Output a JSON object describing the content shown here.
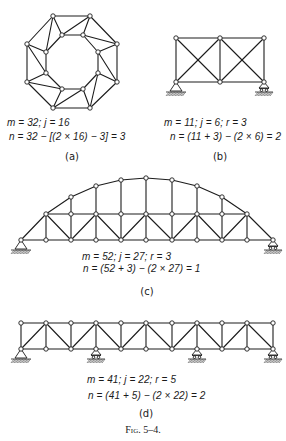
{
  "figure": {
    "caption": "Fig. 5–4.",
    "panels": [
      {
        "id": "a",
        "label": "(a)",
        "line1": "m = 32; j = 16",
        "line2": "n = 32 − [(2 × 16) − 3] = 3"
      },
      {
        "id": "b",
        "label": "(b)",
        "line1": "m = 11; j = 6; r = 3",
        "line2": "n = (11 + 3) − (2 × 6) = 2"
      },
      {
        "id": "c",
        "label": "(c)",
        "line1": "m = 52; j = 27; r = 3",
        "line2": "n = (52 + 3) − (2 × 27) = 1"
      },
      {
        "id": "d",
        "label": "(d)",
        "line1": "m = 41; j = 22; r = 5",
        "line2": "n = (41 + 5) − (2 × 22) = 2"
      }
    ]
  },
  "trusses": [
    {
      "id": "a",
      "description": "octagonal ring truss, free body (no supports)",
      "nodes": [
        [
          53,
          16
        ],
        [
          90,
          16
        ],
        [
          117,
          44
        ],
        [
          117,
          82
        ],
        [
          90,
          108
        ],
        [
          53,
          108
        ],
        [
          27,
          82
        ],
        [
          27,
          44
        ],
        [
          62,
          35
        ],
        [
          83,
          35
        ],
        [
          98,
          52
        ],
        [
          98,
          73
        ],
        [
          83,
          89
        ],
        [
          62,
          89
        ],
        [
          46,
          73
        ],
        [
          46,
          52
        ]
      ],
      "members": [
        [
          0,
          1
        ],
        [
          1,
          2
        ],
        [
          2,
          3
        ],
        [
          3,
          4
        ],
        [
          4,
          5
        ],
        [
          5,
          6
        ],
        [
          6,
          7
        ],
        [
          7,
          0
        ],
        [
          8,
          9
        ],
        [
          9,
          10
        ],
        [
          10,
          11
        ],
        [
          11,
          12
        ],
        [
          12,
          13
        ],
        [
          13,
          14
        ],
        [
          14,
          15
        ],
        [
          15,
          8
        ],
        [
          0,
          8
        ],
        [
          1,
          9
        ],
        [
          2,
          10
        ],
        [
          3,
          11
        ],
        [
          4,
          12
        ],
        [
          5,
          13
        ],
        [
          6,
          14
        ],
        [
          7,
          15
        ],
        [
          0,
          15
        ],
        [
          1,
          8
        ],
        [
          2,
          9
        ],
        [
          3,
          10
        ],
        [
          4,
          11
        ],
        [
          5,
          12
        ],
        [
          6,
          13
        ],
        [
          7,
          14
        ]
      ],
      "supports": []
    },
    {
      "id": "b",
      "description": "two-panel cross-braced truss",
      "nodes": [
        [
          176,
          38
        ],
        [
          220,
          38
        ],
        [
          264,
          38
        ],
        [
          176,
          82
        ],
        [
          220,
          82
        ],
        [
          264,
          82
        ]
      ],
      "members": [
        [
          0,
          1
        ],
        [
          1,
          2
        ],
        [
          3,
          4
        ],
        [
          4,
          5
        ],
        [
          0,
          3
        ],
        [
          1,
          4
        ],
        [
          2,
          5
        ],
        [
          0,
          4
        ],
        [
          1,
          3
        ],
        [
          1,
          5
        ],
        [
          2,
          4
        ]
      ],
      "supports": [
        {
          "type": "pin",
          "node": 3
        },
        {
          "type": "roller",
          "node": 5
        }
      ]
    },
    {
      "id": "c",
      "description": "arched truss",
      "nodes": [
        [
          21,
          240
        ],
        [
          46,
          240
        ],
        [
          71,
          240
        ],
        [
          96,
          240
        ],
        [
          121,
          240
        ],
        [
          146,
          240
        ],
        [
          172,
          240
        ],
        [
          197,
          240
        ],
        [
          222,
          240
        ],
        [
          247,
          240
        ],
        [
          273,
          240
        ],
        [
          46,
          214
        ],
        [
          71,
          214
        ],
        [
          96,
          214
        ],
        [
          121,
          214
        ],
        [
          146,
          214
        ],
        [
          172,
          214
        ],
        [
          197,
          214
        ],
        [
          222,
          214
        ],
        [
          247,
          214
        ],
        [
          71,
          197
        ],
        [
          96,
          186
        ],
        [
          121,
          180
        ],
        [
          146,
          178
        ],
        [
          172,
          180
        ],
        [
          197,
          186
        ],
        [
          222,
          197
        ]
      ],
      "members": [
        [
          0,
          1
        ],
        [
          1,
          2
        ],
        [
          2,
          3
        ],
        [
          3,
          4
        ],
        [
          4,
          5
        ],
        [
          5,
          6
        ],
        [
          6,
          7
        ],
        [
          7,
          8
        ],
        [
          8,
          9
        ],
        [
          9,
          10
        ],
        [
          11,
          12
        ],
        [
          12,
          13
        ],
        [
          13,
          14
        ],
        [
          14,
          15
        ],
        [
          15,
          16
        ],
        [
          16,
          17
        ],
        [
          17,
          18
        ],
        [
          18,
          19
        ],
        [
          0,
          11
        ],
        [
          10,
          19
        ],
        [
          1,
          11
        ],
        [
          2,
          12
        ],
        [
          3,
          13
        ],
        [
          4,
          14
        ],
        [
          5,
          15
        ],
        [
          6,
          16
        ],
        [
          7,
          17
        ],
        [
          8,
          18
        ],
        [
          9,
          19
        ],
        [
          11,
          2
        ],
        [
          13,
          2
        ],
        [
          13,
          4
        ],
        [
          15,
          4
        ],
        [
          15,
          6
        ],
        [
          17,
          6
        ],
        [
          17,
          8
        ],
        [
          19,
          8
        ],
        [
          12,
          20
        ],
        [
          13,
          21
        ],
        [
          14,
          22
        ],
        [
          15,
          23
        ],
        [
          16,
          24
        ],
        [
          17,
          25
        ],
        [
          18,
          26
        ],
        [
          11,
          20
        ],
        [
          20,
          21
        ],
        [
          21,
          22
        ],
        [
          22,
          23
        ],
        [
          23,
          24
        ],
        [
          24,
          25
        ],
        [
          25,
          26
        ],
        [
          26,
          19
        ]
      ],
      "supports": [
        {
          "type": "pin",
          "node": 0
        },
        {
          "type": "roller",
          "node": 10
        }
      ]
    },
    {
      "id": "d",
      "description": "continuous Warren truss with verticals on four supports",
      "nodes": [
        [
          21,
          323
        ],
        [
          46,
          323
        ],
        [
          71,
          323
        ],
        [
          96,
          323
        ],
        [
          121,
          323
        ],
        [
          146,
          323
        ],
        [
          172,
          323
        ],
        [
          197,
          323
        ],
        [
          222,
          323
        ],
        [
          247,
          323
        ],
        [
          273,
          323
        ],
        [
          21,
          349
        ],
        [
          46,
          349
        ],
        [
          71,
          349
        ],
        [
          96,
          349
        ],
        [
          121,
          349
        ],
        [
          146,
          349
        ],
        [
          172,
          349
        ],
        [
          197,
          349
        ],
        [
          222,
          349
        ],
        [
          247,
          349
        ],
        [
          273,
          349
        ]
      ],
      "members": [
        [
          0,
          1
        ],
        [
          1,
          2
        ],
        [
          2,
          3
        ],
        [
          3,
          4
        ],
        [
          4,
          5
        ],
        [
          5,
          6
        ],
        [
          6,
          7
        ],
        [
          7,
          8
        ],
        [
          8,
          9
        ],
        [
          9,
          10
        ],
        [
          11,
          12
        ],
        [
          12,
          13
        ],
        [
          13,
          14
        ],
        [
          14,
          15
        ],
        [
          15,
          16
        ],
        [
          16,
          17
        ],
        [
          17,
          18
        ],
        [
          18,
          19
        ],
        [
          19,
          20
        ],
        [
          20,
          21
        ],
        [
          0,
          11
        ],
        [
          1,
          12
        ],
        [
          2,
          13
        ],
        [
          3,
          14
        ],
        [
          4,
          15
        ],
        [
          5,
          16
        ],
        [
          6,
          17
        ],
        [
          7,
          18
        ],
        [
          8,
          19
        ],
        [
          9,
          20
        ],
        [
          10,
          21
        ],
        [
          11,
          1
        ],
        [
          1,
          13
        ],
        [
          13,
          3
        ],
        [
          3,
          15
        ],
        [
          15,
          5
        ],
        [
          5,
          17
        ],
        [
          17,
          7
        ],
        [
          7,
          19
        ],
        [
          19,
          9
        ],
        [
          9,
          21
        ]
      ],
      "supports": [
        {
          "type": "pin",
          "node": 11
        },
        {
          "type": "roller",
          "node": 14
        },
        {
          "type": "roller",
          "node": 18
        },
        {
          "type": "roller",
          "node": 21
        }
      ]
    }
  ]
}
